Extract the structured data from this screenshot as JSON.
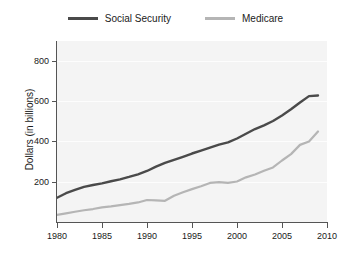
{
  "legend": {
    "position": "top-center",
    "entries": [
      {
        "label": "Social Security",
        "color": "#4a4a4a",
        "icon": "line-swatch-icon"
      },
      {
        "label": "Medicare",
        "color": "#b5b5b5",
        "icon": "line-swatch-icon"
      }
    ]
  },
  "axes": {
    "ylabel": "Dollars (in billions)",
    "xlabel": "",
    "y_ticks": [
      "200",
      "400",
      "600",
      "800"
    ],
    "x_ticks": [
      "1980",
      "1985",
      "1990",
      "1995",
      "2000",
      "2005",
      "2010"
    ]
  },
  "colors": {
    "plot_background": "#f4f4f4",
    "page_background": "#ffffff",
    "axis": "#555555",
    "gridline": "#fdfdfd",
    "social_security": "#4a4a4a",
    "medicare": "#b5b5b5"
  },
  "chart_data": {
    "type": "line",
    "title": "",
    "xlabel": "",
    "ylabel": "Dollars (in billions)",
    "xlim": [
      1980,
      2010
    ],
    "ylim": [
      0,
      880
    ],
    "grid": true,
    "legend_position": "top-center",
    "x": [
      1980,
      1981,
      1982,
      1983,
      1984,
      1985,
      1986,
      1987,
      1988,
      1989,
      1990,
      1991,
      1992,
      1993,
      1994,
      1995,
      1996,
      1997,
      1998,
      1999,
      2000,
      2001,
      2002,
      2003,
      2004,
      2005,
      2006,
      2007,
      2008,
      2009
    ],
    "series": [
      {
        "name": "Social Security",
        "color": "#4a4a4a",
        "values": [
          118,
          140,
          156,
          171,
          180,
          188,
          198,
          207,
          219,
          232,
          248,
          269,
          287,
          302,
          317,
          333,
          347,
          362,
          376,
          387,
          406,
          429,
          452,
          470,
          491,
          518,
          548,
          581,
          612,
          615
        ]
      },
      {
        "name": "Medicare",
        "color": "#b5b5b5",
        "values": [
          35,
          42,
          50,
          57,
          63,
          71,
          76,
          82,
          88,
          95,
          107,
          105,
          103,
          128,
          145,
          160,
          174,
          190,
          194,
          190,
          197,
          217,
          231,
          249,
          265,
          299,
          330,
          375,
          391,
          440
        ]
      }
    ]
  }
}
